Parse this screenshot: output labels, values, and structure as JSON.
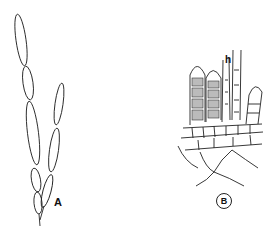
{
  "figure": {
    "panels": [
      {
        "id": "A",
        "label": "A",
        "description": "branched filament of elongated cells"
      },
      {
        "id": "B",
        "label": "B",
        "description": "cellular tissue with upright filaments",
        "annotations": [
          {
            "label": "h"
          }
        ]
      }
    ],
    "colors": {
      "ink": "#222222",
      "background": "#ffffff",
      "stipple": "#888888"
    }
  }
}
